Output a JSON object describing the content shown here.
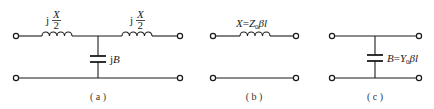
{
  "figure": {
    "panels": [
      {
        "id": "a",
        "caption": "( a )",
        "description": "T-network: two series inductors jX/2 with shunt capacitor jB",
        "series_labels": [
          {
            "prefix": "j",
            "numerator": "X",
            "denominator": "2"
          },
          {
            "prefix": "j",
            "numerator": "X",
            "denominator": "2"
          }
        ],
        "shunt_label": {
          "prefix": "j",
          "symbol": "B"
        }
      },
      {
        "id": "b",
        "caption": "( b )",
        "description": "Series inductor",
        "label": {
          "lhs": "X",
          "eq": "=",
          "Z": "Z",
          "sub": "0",
          "rest": "βl"
        }
      },
      {
        "id": "c",
        "caption": "( c )",
        "description": "Shunt capacitor",
        "label": {
          "lhs": "B",
          "eq": "=",
          "Y": "Y",
          "sub": "0",
          "rest": "βl"
        }
      }
    ],
    "colors": {
      "line": "#1a1a1a",
      "background": "#ffffff"
    }
  }
}
